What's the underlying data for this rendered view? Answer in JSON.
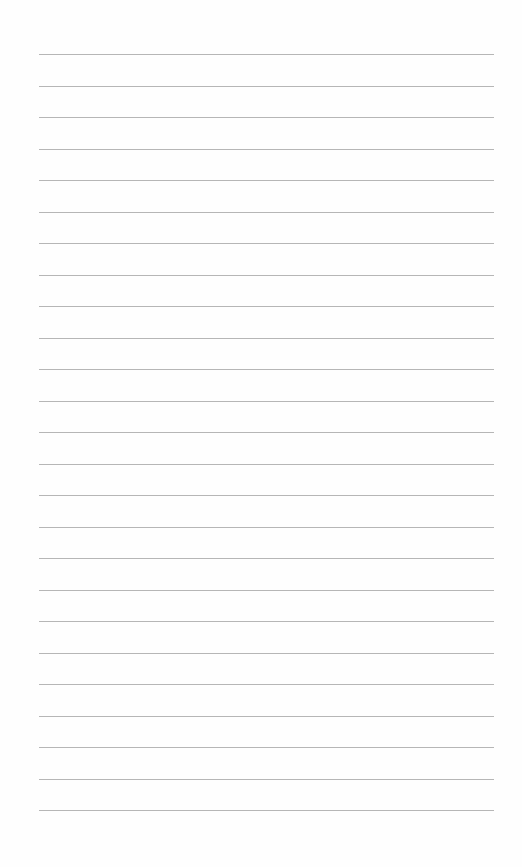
{
  "page": {
    "type": "lined-paper",
    "background": "#fefefe",
    "line_color": "#a9a9a9",
    "line_count": 25,
    "first_line_y": 54,
    "line_spacing": 31.5,
    "line_left": 39,
    "line_right": 494
  }
}
